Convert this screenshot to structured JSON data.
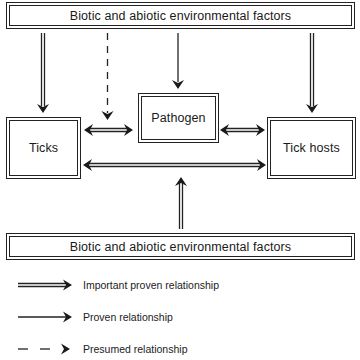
{
  "diagram": {
    "nodes": {
      "env_top": {
        "label": "Biotic and abiotic environmental factors"
      },
      "pathogen": {
        "label": "Pathogen"
      },
      "ticks": {
        "label": "Ticks"
      },
      "tick_hosts": {
        "label": "Tick hosts"
      },
      "env_bottom": {
        "label": "Biotic and abiotic environmental factors"
      }
    },
    "edges": [
      {
        "from": "env_top",
        "to": "ticks",
        "type": "important_proven"
      },
      {
        "from": "env_top",
        "to": "ticks-pathogen-link",
        "type": "presumed"
      },
      {
        "from": "env_top",
        "to": "pathogen",
        "type": "proven"
      },
      {
        "from": "env_top",
        "to": "tick_hosts",
        "type": "important_proven"
      },
      {
        "from": "ticks",
        "to": "pathogen",
        "type": "important_proven",
        "bidirectional": true
      },
      {
        "from": "pathogen",
        "to": "tick_hosts",
        "type": "important_proven",
        "bidirectional": true
      },
      {
        "from": "ticks",
        "to": "tick_hosts",
        "type": "important_proven",
        "bidirectional": true
      },
      {
        "from": "env_bottom",
        "to": "ticks-hosts-link",
        "type": "important_proven"
      }
    ]
  },
  "legend": {
    "items": [
      {
        "type": "important_proven",
        "label": "Important proven relationship"
      },
      {
        "type": "proven",
        "label": "Proven relationship"
      },
      {
        "type": "presumed",
        "label": "Presumed relationship"
      }
    ]
  },
  "colors": {
    "line": "#222222",
    "background": "#ffffff"
  }
}
